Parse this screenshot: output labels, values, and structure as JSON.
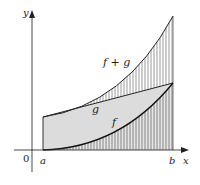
{
  "figure": {
    "type": "function-sum-area-diagram",
    "axes": {
      "x_label": "x",
      "y_label": "y",
      "origin_label": "0"
    },
    "interval": {
      "left_label": "a",
      "right_label": "b"
    },
    "curves": [
      {
        "name": "f",
        "label": "f",
        "description": "increasing concave-up curve starting at 0 at x=a"
      },
      {
        "name": "g",
        "label": "g",
        "description": "straight increasing line"
      },
      {
        "name": "f+g",
        "label": "f + g",
        "description": "sum curve, concave up, top boundary"
      }
    ],
    "regions": [
      {
        "name": "area-under-f",
        "fill": "vertical-hatch",
        "between": [
          "x-axis",
          "f"
        ]
      },
      {
        "name": "area-between-f-and-g",
        "fill": "gray",
        "between": [
          "f",
          "g"
        ]
      },
      {
        "name": "area-between-g-and-f+g",
        "fill": "vertical-hatch",
        "between": [
          "g",
          "f+g"
        ]
      }
    ],
    "colors": {
      "gray_fill": "#dcdcdc",
      "hatch": "#6e6e6e",
      "curve": "#222222",
      "axis": "#333333"
    }
  }
}
